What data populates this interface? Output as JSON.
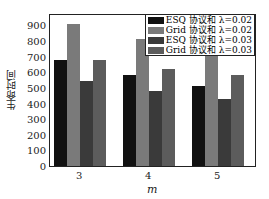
{
  "chart_data": {
    "type": "bar",
    "title": "",
    "xlabel": "m",
    "ylabel": "生命时间",
    "categories": [
      "3",
      "4",
      "5"
    ],
    "ylim": [
      0,
      980
    ],
    "yticks": [
      0,
      100,
      200,
      300,
      400,
      500,
      600,
      700,
      800,
      900
    ],
    "grid": false,
    "legend_position": "upper right",
    "series": [
      {
        "name": "ESQ 协议和 λ=0.02",
        "color": "#111111",
        "values": [
          682,
          580,
          510
        ]
      },
      {
        "name": "Grid 协议和 λ=0.02",
        "color": "#7a7a7a",
        "values": [
          910,
          815,
          720
        ]
      },
      {
        "name": "ESQ 协议和 λ=0.03",
        "color": "#3a3a3a",
        "values": [
          545,
          478,
          427
        ]
      },
      {
        "name": "Grid 协议和 λ=0.03",
        "color": "#5c5c5c",
        "values": [
          680,
          624,
          580
        ]
      }
    ]
  }
}
